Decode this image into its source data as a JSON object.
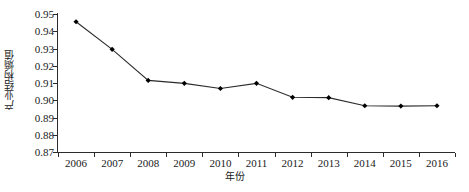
{
  "chart_data": {
    "type": "line",
    "title": "",
    "xlabel": "年份",
    "ylabel": "产业结构熵值",
    "categories": [
      "2006",
      "2007",
      "2008",
      "2009",
      "2010",
      "2011",
      "2012",
      "2013",
      "2014",
      "2015",
      "2016"
    ],
    "values": [
      0.9455,
      0.9295,
      0.9115,
      0.9098,
      0.9068,
      0.9098,
      0.9017,
      0.9015,
      0.8968,
      0.8966,
      0.8968
    ],
    "series": [
      {
        "name": "产业结构熵值",
        "values": [
          0.9455,
          0.9295,
          0.9115,
          0.9098,
          0.9068,
          0.9098,
          0.9017,
          0.9015,
          0.8968,
          0.8966,
          0.8968
        ]
      }
    ],
    "ylim": [
      0.87,
      0.95
    ],
    "ytick_labels": [
      "0.95",
      "0.94",
      "0.93",
      "0.92",
      "0.91",
      "0.90",
      "0.89",
      "0.88",
      "0.87"
    ],
    "ytick_values": [
      0.95,
      0.94,
      0.93,
      0.92,
      0.91,
      0.9,
      0.89,
      0.88,
      0.87
    ],
    "grid": false,
    "legend": false,
    "legend_position": "none",
    "marker": "diamond",
    "line_color": "#2b2b2b",
    "marker_color": "#000000"
  }
}
